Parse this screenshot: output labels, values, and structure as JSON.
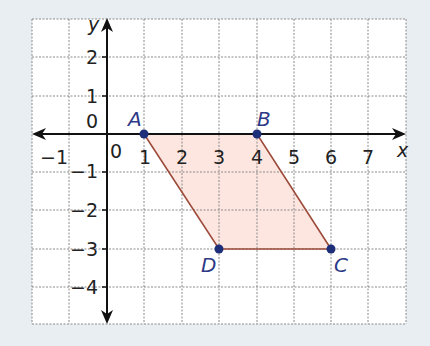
{
  "diagram": {
    "type": "coordinate-plane",
    "axes": {
      "x_label": "x",
      "y_label": "y",
      "x_ticks": [
        "−1",
        "0",
        "1",
        "2",
        "3",
        "4",
        "5",
        "6",
        "7"
      ],
      "y_ticks_positive": [
        "2",
        "1"
      ],
      "y_ticks_negative": [
        "−1",
        "−2",
        "−3",
        "−4"
      ],
      "y_zero_label": "0",
      "x_range": [
        -2,
        8
      ],
      "y_range": [
        -5,
        3
      ]
    },
    "grid": {
      "style": "dashed",
      "color": "#8a8a8a"
    },
    "shape": {
      "name": "parallelogram ABCD",
      "fill": "#fde6e0",
      "stroke": "#9c4a3a",
      "vertices": [
        {
          "label": "A",
          "x": 1,
          "y": 0
        },
        {
          "label": "B",
          "x": 4,
          "y": 0
        },
        {
          "label": "C",
          "x": 6,
          "y": -3
        },
        {
          "label": "D",
          "x": 3,
          "y": -3
        }
      ]
    },
    "point_color": "#1e2f7a",
    "background": "#e9eef3"
  }
}
